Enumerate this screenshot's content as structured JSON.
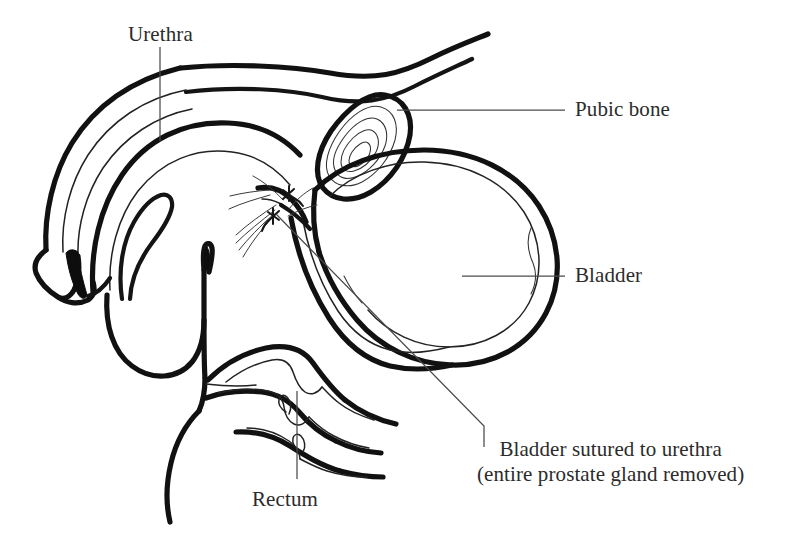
{
  "figure": {
    "background_color": "#ffffff",
    "ink_color": "#111111",
    "leader_color": "#4a4a4a",
    "width": 786,
    "height": 533
  },
  "labels": {
    "urethra": "Urethra",
    "pubic_bone": "Pubic bone",
    "bladder": "Bladder",
    "rectum": "Rectum",
    "anastomosis_line1": "Bladder sutured to urethra",
    "anastomosis_line2": "(entire prostate gland removed)"
  },
  "structures": [
    {
      "name": "penis-shaft",
      "description": "Curved penile shaft with corpus cavernosum and urethral channel"
    },
    {
      "name": "glans-penis",
      "description": "Distal glans with urethral meatus"
    },
    {
      "name": "urethra-lumen",
      "description": "Dark urethral lumen within shaft"
    },
    {
      "name": "scrotum",
      "description": "U-shaped scrotal sac below shaft"
    },
    {
      "name": "pubic-bone",
      "description": "Oval pubic bone in cross section with concentric trabecular rings"
    },
    {
      "name": "abdominal-wall",
      "description": "Two diagonal lines rising to upper right"
    },
    {
      "name": "bladder",
      "description": "Large rounded bladder with thick outer wall and wavy inner mucosa"
    },
    {
      "name": "rectum",
      "description": "Rectum with thick walls and wavy mucosal folds extending lower right"
    },
    {
      "name": "suture-site",
      "description": "Vesicourethral anastomosis marked by stitch crosses"
    },
    {
      "name": "pelvic-fascia",
      "description": "Fan of thin fascial fibers near anastomosis"
    }
  ]
}
